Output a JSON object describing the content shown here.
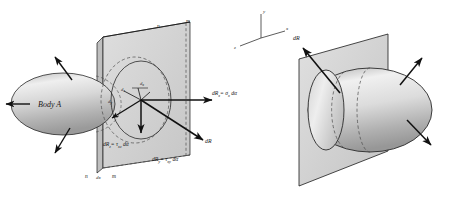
{
  "figure": {
    "title": "",
    "left_diagram": {
      "body_label": "Body A",
      "plane_labels_top": [
        "n",
        "m"
      ],
      "plane_labels_bottom": [
        "n",
        "m"
      ],
      "thickness_label": "dx",
      "force_labels": {
        "dRx": "dR",
        "dRx_sub": "x",
        "dRx_eq": "= σ",
        "dRx_eq_sub": "x",
        "dRx_tail": " dα",
        "dRy": "dR",
        "dRy_sub": "y",
        "dRy_eq": "= τ",
        "dRy_eq_sub": "xy",
        "dRy_tail": " dα",
        "dRz": "dR",
        "dRz_sub": "z",
        "dRz_eq": "= τ",
        "dRz_eq_sub": "xz",
        "dRz_tail": " dα",
        "dR": "dR"
      },
      "component_labels": [
        {
          "text": "dz",
          "main": "d",
          "sub": "z"
        },
        {
          "text": "dx",
          "main": "d",
          "sub": "x"
        },
        {
          "text": "dy",
          "main": "d",
          "sub": "y"
        }
      ]
    },
    "right_diagram": {
      "resultant_label": "dR",
      "axes": [
        {
          "label": "y",
          "dir": "up"
        },
        {
          "label": "x",
          "dir": "right"
        },
        {
          "label": "z",
          "dir": "lower-left"
        }
      ]
    },
    "colors": {
      "body_light": "#e9e9e9",
      "body_mid": "#c9c9c9",
      "body_dark": "#9a9a9a",
      "plane_fill": "#d6d6d6",
      "plane_fill_light": "#e2e2e2",
      "outline": "#1a1a1a",
      "dashed": "#4a4a4a",
      "background": "#ffffff"
    }
  }
}
